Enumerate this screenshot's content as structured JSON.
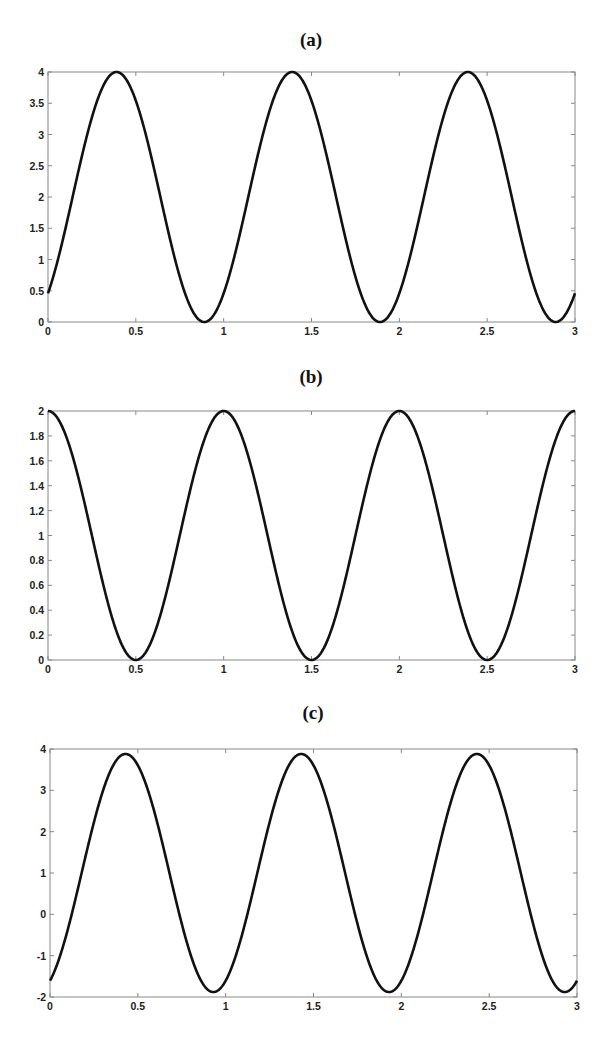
{
  "chart_data": [
    {
      "type": "line",
      "title": "(a)",
      "xlabel": "",
      "ylabel": "",
      "xlim": [
        0,
        3
      ],
      "ylim": [
        0,
        4
      ],
      "xticks": [
        0,
        0.5,
        1,
        1.5,
        2,
        2.5,
        3
      ],
      "xtick_labels": [
        "0",
        "0.5",
        "1",
        "1.5",
        "2",
        "2.5",
        "3"
      ],
      "yticks": [
        0,
        0.5,
        1,
        1.5,
        2,
        2.5,
        3,
        3.5,
        4
      ],
      "ytick_labels": [
        "0",
        "0.5",
        "1",
        "1.5",
        "2",
        "2.5",
        "3",
        "3.5",
        "4"
      ],
      "grid": false,
      "legend": null,
      "series": [
        {
          "name": "curve-a",
          "description": "periodic, period 1, min 0, max 4",
          "model": {
            "offset": 2,
            "amplitude": 2,
            "period": 1,
            "phase": 0.14,
            "form": "sin"
          },
          "x": [
            0,
            0.14,
            0.39,
            0.64,
            0.89,
            1.14,
            1.39,
            1.64,
            1.89,
            2.14,
            2.39,
            2.64,
            2.89,
            3.0
          ],
          "y": [
            0.4,
            2,
            4,
            2,
            0,
            2,
            4,
            2,
            0,
            2,
            4,
            2,
            0,
            0.4
          ]
        }
      ]
    },
    {
      "type": "line",
      "title": "(b)",
      "xlabel": "",
      "ylabel": "",
      "xlim": [
        0,
        3
      ],
      "ylim": [
        0,
        2
      ],
      "xticks": [
        0,
        0.5,
        1,
        1.5,
        2,
        2.5,
        3
      ],
      "xtick_labels": [
        "0",
        "0.5",
        "1",
        "1.5",
        "2",
        "2.5",
        "3"
      ],
      "yticks": [
        0,
        0.2,
        0.4,
        0.6,
        0.8,
        1,
        1.2,
        1.4,
        1.6,
        1.8,
        2
      ],
      "ytick_labels": [
        "0",
        "0.2",
        "0.4",
        "0.6",
        "0.8",
        "1",
        "1.2",
        "1.4",
        "1.6",
        "1.8",
        "2"
      ],
      "grid": false,
      "legend": null,
      "series": [
        {
          "name": "curve-b",
          "description": "periodic, period 1, min 0, max 2",
          "model": {
            "offset": 1,
            "amplitude": 1,
            "period": 1,
            "phase": 0,
            "form": "cos"
          },
          "x": [
            0,
            0.25,
            0.5,
            0.75,
            1,
            1.25,
            1.5,
            1.75,
            2,
            2.25,
            2.5,
            2.75,
            3
          ],
          "y": [
            2,
            1,
            0,
            1,
            2,
            1,
            0,
            1,
            2,
            1,
            0,
            1,
            2
          ]
        }
      ]
    },
    {
      "type": "line",
      "title": "(c)",
      "xlabel": "",
      "ylabel": "",
      "xlim": [
        0,
        3
      ],
      "ylim": [
        -2,
        4
      ],
      "xticks": [
        0,
        0.5,
        1,
        1.5,
        2,
        2.5,
        3
      ],
      "xtick_labels": [
        "0",
        "0.5",
        "1",
        "1.5",
        "2",
        "2.5",
        "3"
      ],
      "yticks": [
        -2,
        -1,
        0,
        1,
        2,
        3,
        4
      ],
      "ytick_labels": [
        "-2",
        "-1",
        "0",
        "1",
        "2",
        "3",
        "4"
      ],
      "grid": false,
      "legend": null,
      "series": [
        {
          "name": "curve-c",
          "description": "periodic, period 1, min about -1.88, max about 3.88",
          "model": {
            "offset": 1,
            "amplitude": 2.88,
            "period": 1,
            "phase": 0.18,
            "form": "sin"
          },
          "x": [
            0,
            0.18,
            0.43,
            0.68,
            0.93,
            1.18,
            1.43,
            1.68,
            1.93,
            2.18,
            2.43,
            2.68,
            2.93,
            3.0
          ],
          "y": [
            -1.6,
            1,
            3.88,
            1,
            -1.88,
            1,
            3.88,
            1,
            -1.88,
            1,
            3.88,
            1,
            -1.88,
            -1.6
          ]
        }
      ]
    }
  ],
  "panels": [
    {
      "title": "(a)",
      "box": {
        "left": 48,
        "top": 72,
        "right": 575,
        "bottom": 322
      },
      "title_pos": {
        "x": 311,
        "y": 40
      }
    },
    {
      "title": "(b)",
      "box": {
        "left": 48,
        "top": 411,
        "right": 575,
        "bottom": 660
      },
      "title_pos": {
        "x": 311,
        "y": 377
      }
    },
    {
      "title": "(c)",
      "box": {
        "left": 50,
        "top": 749,
        "right": 577,
        "bottom": 997
      },
      "title_pos": {
        "x": 313,
        "y": 713
      }
    }
  ],
  "style": {
    "curve_color": "#111111",
    "frame_color": "#888888",
    "background": "#ffffff"
  }
}
